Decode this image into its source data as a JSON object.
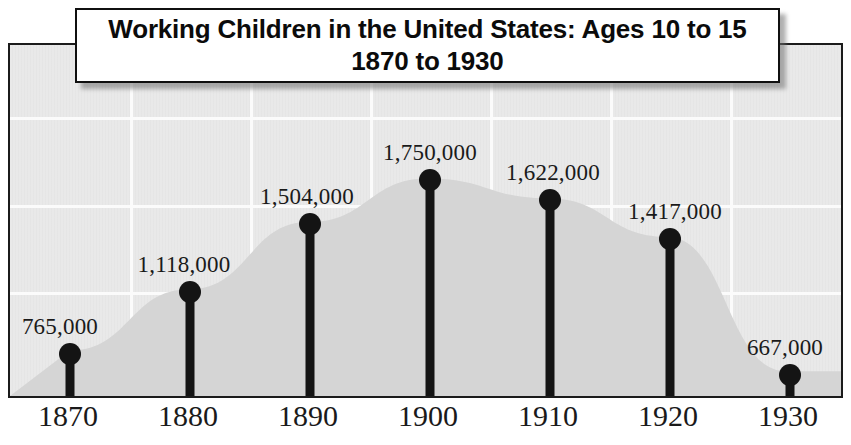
{
  "title": {
    "line1": "Working Children in the United States: Ages 10 to 15",
    "line2": "1870 to 1930"
  },
  "colors": {
    "plot_background": "#e9e9e9",
    "area_fill": "#d5d5d5",
    "gridline": "#fbfbfb",
    "marker": "#141414",
    "border": "#1b1b1b",
    "title_background": "#ffffff",
    "text": "#1a1a1a"
  },
  "chart_data": {
    "type": "line",
    "title": "Working Children in the United States: Ages 10 to 15 1870 to 1930",
    "xlabel": "",
    "ylabel": "",
    "grid": true,
    "legend": "none",
    "categories": [
      "1870",
      "1880",
      "1890",
      "1900",
      "1910",
      "1920",
      "1930"
    ],
    "values": [
      765000,
      1118000,
      1750000,
      1750000,
      1622000,
      1417000,
      667000
    ],
    "value_labels": [
      "765,000",
      "1,118,000",
      "1,504,000",
      "1,750,000",
      "1,622,000",
      "1,417,000",
      "667,000"
    ],
    "points": [
      {
        "x": "1870",
        "value": 765000,
        "label": "765,000",
        "px": 68,
        "py": 352,
        "label_px": 58,
        "label_py": 338
      },
      {
        "x": "1880",
        "value": 1118000,
        "label": "1,118,000",
        "px": 188,
        "py": 290,
        "label_px": 182,
        "label_py": 276
      },
      {
        "x": "1890",
        "value": 1504000,
        "label": "1,504,000",
        "px": 308,
        "py": 222,
        "label_px": 305,
        "label_py": 208
      },
      {
        "x": "1900",
        "value": 1750000,
        "label": "1,750,000",
        "px": 428,
        "py": 178,
        "label_px": 428,
        "label_py": 164
      },
      {
        "x": "1910",
        "value": 1622000,
        "label": "1,622,000",
        "px": 548,
        "py": 198,
        "label_px": 551,
        "label_py": 184
      },
      {
        "x": "1920",
        "value": 1417000,
        "label": "1,417,000",
        "px": 668,
        "py": 237,
        "label_px": 673,
        "label_py": 223
      },
      {
        "x": "1930",
        "value": 667000,
        "label": "667,000",
        "px": 788,
        "py": 373,
        "label_px": 783,
        "label_py": 359
      }
    ],
    "axis_ticks": [
      {
        "label": "1870",
        "px": 68
      },
      {
        "label": "1880",
        "px": 188
      },
      {
        "label": "1890",
        "px": 308
      },
      {
        "label": "1900",
        "px": 428
      },
      {
        "label": "1910",
        "px": 548
      },
      {
        "label": "1920",
        "px": 668
      },
      {
        "label": "1930",
        "px": 788
      }
    ],
    "gridlines": {
      "horizontal_py": [
        115,
        203,
        290
      ],
      "vertical_px": [
        128,
        248,
        368,
        488,
        608,
        728
      ]
    },
    "ylim": [
      0,
      2000000
    ]
  }
}
